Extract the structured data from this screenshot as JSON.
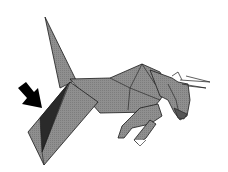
{
  "diagram": {
    "annotation": "arrow pointing at wing fold",
    "colors": {
      "paper": "#8c8c8c",
      "shadow": "#2a2a2a",
      "outline": "#1a1a1a",
      "background": "#ffffff",
      "arrow": "#000000"
    }
  }
}
